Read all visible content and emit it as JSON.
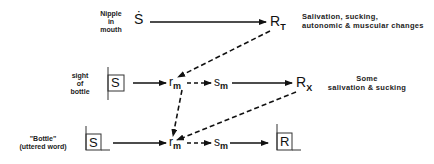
{
  "rows": [
    {
      "stimulus_label": [
        "Nipple",
        "in",
        "mouth"
      ],
      "stimulus_symbol": "Ṡ",
      "response_symbol": "R",
      "response_sub": "T",
      "description": [
        "Salivation, sucking,",
        "autonomic & muscular  changes"
      ]
    },
    {
      "stimulus_label": [
        "sight",
        "of",
        "bottle"
      ],
      "stimulus_symbol": "S",
      "mediator_r": "r",
      "mediator_r_sub": "m",
      "mediator_s": "s",
      "mediator_s_sub": "m",
      "response_symbol": "R",
      "response_sub": "X",
      "description": [
        "Some",
        "salivation & sucking"
      ]
    },
    {
      "stimulus_label": [
        "\"Bottle\"",
        "(uttered  word)"
      ],
      "stimulus_symbol": "S",
      "mediator_r": "r",
      "mediator_r_sub": "m",
      "mediator_s": "s",
      "mediator_s_sub": "m",
      "response_symbol": "R"
    }
  ]
}
